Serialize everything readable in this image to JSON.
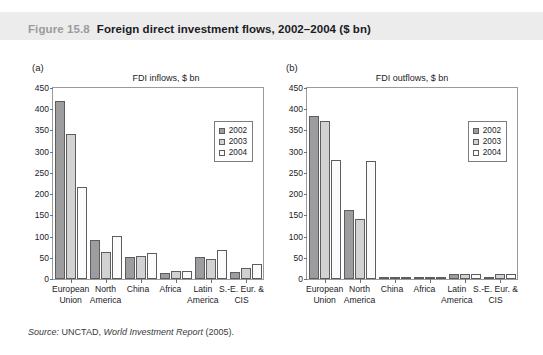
{
  "figure": {
    "number": "Figure 15.8",
    "title": "Foreign direct investment flows, 2002–2004 ($ bn)",
    "source_prefix": "Source:",
    "source_org": "UNCTAD,",
    "source_pub": "World Investment Report",
    "source_year": "(2005)."
  },
  "colors": {
    "band": "#ececed",
    "fig_number": "#9b9b9e",
    "series_2002": "#9d9d9f",
    "series_2003": "#d2d2d3",
    "series_2004": "#fbfbfb",
    "axis": "#9a9a9d",
    "text": "#1b1b1f"
  },
  "panels": [
    {
      "letter": "(a)",
      "caption": "FDI inflows, $ bn"
    },
    {
      "letter": "(b)",
      "caption": "FDI outflows, $ bn"
    }
  ],
  "yticks": [
    "450",
    "400",
    "350",
    "300",
    "250",
    "200",
    "150",
    "100",
    "50",
    "0"
  ],
  "legend": [
    {
      "label": "2002",
      "key": "y2002"
    },
    {
      "label": "2003",
      "key": "y2003"
    },
    {
      "label": "2004",
      "key": "y2004"
    }
  ],
  "categories": [
    {
      "l1": "European",
      "l2": "Union"
    },
    {
      "l1": "North",
      "l2": "America"
    },
    {
      "l1": "China",
      "l2": ""
    },
    {
      "l1": "Africa",
      "l2": ""
    },
    {
      "l1": "Latin",
      "l2": "America"
    },
    {
      "l1": "S.-E. Eur. &",
      "l2": "CIS"
    }
  ],
  "chart_data": [
    {
      "type": "bar",
      "title": "FDI inflows, $ bn",
      "panel": "(a)",
      "xlabel": "",
      "ylabel": "$ bn",
      "ylim": [
        0,
        450
      ],
      "yticks": [
        0,
        50,
        100,
        150,
        200,
        250,
        300,
        350,
        400,
        450
      ],
      "grid": false,
      "legend_position": "top-right",
      "categories": [
        "European Union",
        "North America",
        "China",
        "Africa",
        "Latin America",
        "S.-E. Eur. & CIS"
      ],
      "series": [
        {
          "name": "2002",
          "values": [
            420,
            93,
            53,
            14,
            52,
            16
          ]
        },
        {
          "name": "2003",
          "values": [
            341,
            64,
            54,
            19,
            48,
            27
          ]
        },
        {
          "name": "2004",
          "values": [
            216,
            102,
            61,
            19,
            68,
            36
          ]
        }
      ]
    },
    {
      "type": "bar",
      "title": "FDI outflows, $ bn",
      "panel": "(b)",
      "xlabel": "",
      "ylabel": "$ bn",
      "ylim": [
        0,
        450
      ],
      "yticks": [
        0,
        50,
        100,
        150,
        200,
        250,
        300,
        350,
        400,
        450
      ],
      "grid": false,
      "legend_position": "top-right",
      "categories": [
        "European Union",
        "North America",
        "China",
        "Africa",
        "Latin America",
        "S.-E. Eur. & CIS"
      ],
      "series": [
        {
          "name": "2002",
          "values": [
            385,
            162,
            3,
            1,
            12,
            5
          ]
        },
        {
          "name": "2003",
          "values": [
            372,
            141,
            2,
            1,
            11,
            11
          ]
        },
        {
          "name": "2004",
          "values": [
            280,
            277,
            2,
            2,
            11,
            11
          ]
        }
      ]
    }
  ]
}
